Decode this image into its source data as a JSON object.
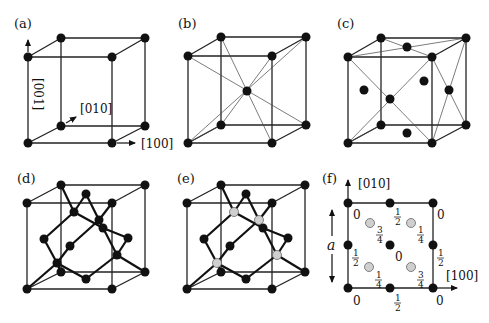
{
  "panels": {
    "a": {
      "label": "(a)",
      "title": "Simple cubic lattice",
      "axis_labels": {
        "x": "[100]",
        "y": "[010]",
        "z": "[001]"
      }
    },
    "b": {
      "label": "(b)",
      "title": "Body-centered cubic lattice"
    },
    "c": {
      "label": "(c)",
      "title": "Face-centered cubic lattice"
    },
    "d": {
      "label": "(d)",
      "title": "Diamond structure"
    },
    "e": {
      "label": "(e)",
      "title": "Zincblende structure"
    },
    "f": {
      "label": "(f)",
      "title": "Projection onto (001) plane",
      "axis_labels": {
        "x": "[100]",
        "y": "[010]"
      },
      "lattice_constant": "a",
      "heights": {
        "corner_tl": "0",
        "corner_tr": "0",
        "corner_bl": "0",
        "corner_br": "0",
        "edge_top": "1/2",
        "edge_bottom": "1/2",
        "edge_left": "1/2",
        "edge_right": "1/2",
        "center": "0",
        "gray_tl": "3/4",
        "gray_tr": "1/4",
        "gray_bl": "1/4",
        "gray_br": "3/4"
      },
      "frac": {
        "half_n": "1",
        "half_d": "2",
        "q1_n": "1",
        "q1_d": "4",
        "q3_n": "3",
        "q3_d": "4",
        "zero": "0"
      }
    }
  },
  "colors": {
    "atom_dark": "#111111",
    "atom_gray": "#cfcfcf",
    "line": "#222222"
  }
}
